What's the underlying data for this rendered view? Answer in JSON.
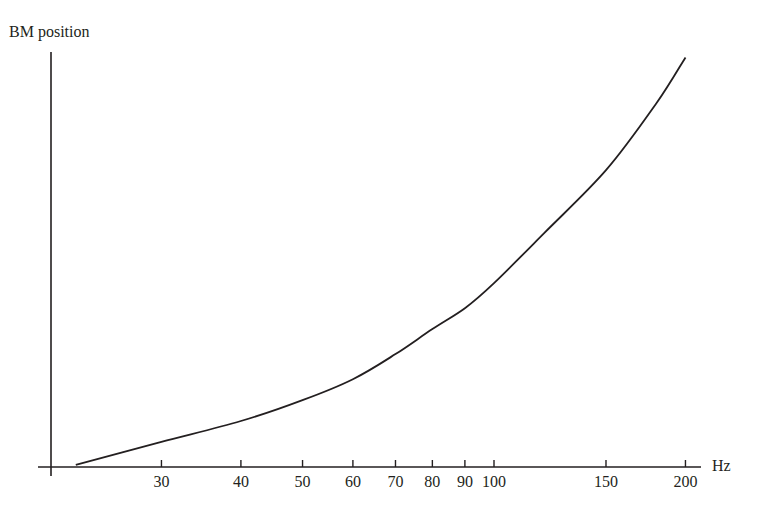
{
  "chart_data": {
    "type": "line",
    "title": "",
    "xlabel": "Hz",
    "ylabel": "BM position",
    "x_scale": "log",
    "xlim": [
      20,
      210
    ],
    "ylim": [
      0,
      1
    ],
    "grid": false,
    "legend": null,
    "x_ticks": [
      30,
      40,
      50,
      60,
      70,
      80,
      90,
      100,
      150,
      200
    ],
    "x_tick_labels": [
      "30",
      "40",
      "50",
      "60",
      "70",
      "80",
      "90",
      "100",
      "150",
      "200"
    ],
    "y_ticks": [],
    "series": [
      {
        "name": "BM position vs frequency",
        "x": [
          22,
          30,
          40,
          50,
          60,
          70,
          80,
          90,
          100,
          120,
          150,
          180,
          200
        ],
        "y": [
          0.005,
          0.06,
          0.11,
          0.16,
          0.21,
          0.27,
          0.33,
          0.38,
          0.44,
          0.56,
          0.71,
          0.87,
          0.98
        ]
      }
    ]
  },
  "layout": {
    "origin_px": [
      51,
      467
    ],
    "x_axis_end_px": 701,
    "y_axis_top_px": 52,
    "px_per_decade": 636,
    "x_ref_hz": 100,
    "x_ref_px": 494,
    "y_unit_px": 418
  }
}
